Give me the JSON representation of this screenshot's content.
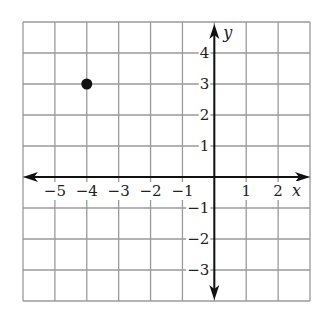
{
  "chart_data": {
    "type": "scatter",
    "title": "",
    "xlabel": "x",
    "ylabel": "y",
    "xlim": [
      -6,
      3
    ],
    "ylim": [
      -4,
      5
    ],
    "grid": true,
    "x_tick_labels": [
      "−5",
      "−4",
      "−3",
      "−2",
      "−1",
      "1",
      "2"
    ],
    "x_tick_values": [
      -5,
      -4,
      -3,
      -2,
      -1,
      1,
      2
    ],
    "y_tick_labels": [
      "4",
      "3",
      "2",
      "1",
      "−1",
      "−2",
      "−3"
    ],
    "y_tick_values": [
      4,
      3,
      2,
      1,
      -1,
      -2,
      -3
    ],
    "series": [
      {
        "name": "point",
        "points": [
          {
            "x": -4,
            "y": 3
          }
        ]
      }
    ]
  },
  "axes": {
    "x_name": "x",
    "y_name": "y"
  },
  "colors": {
    "grid": "#9a9a9a",
    "axis": "#111111",
    "point": "#111111"
  }
}
